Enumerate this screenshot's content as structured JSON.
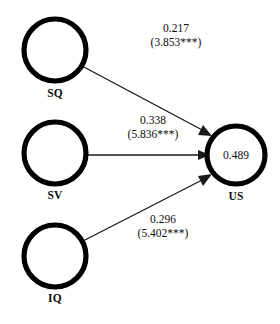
{
  "diagram": {
    "type": "path-diagram",
    "background_color": "#ffffff",
    "stroke_color": "#000000",
    "arrow_color": "#1a1a1a",
    "nodes": [
      {
        "id": "SQ",
        "label": "SQ",
        "value": "",
        "cx": 55,
        "cy": 50,
        "r": 31
      },
      {
        "id": "SV",
        "label": "SV",
        "value": "",
        "cx": 55,
        "cy": 153,
        "r": 31
      },
      {
        "id": "IQ",
        "label": "IQ",
        "value": "",
        "cx": 55,
        "cy": 256,
        "r": 31
      },
      {
        "id": "US",
        "label": "US",
        "value": "0.489",
        "cx": 236,
        "cy": 155,
        "r": 29
      }
    ],
    "edges": [
      {
        "from": "SQ",
        "to": "US",
        "coefficient": "0.217",
        "t_statistic": "(3.853***)",
        "label_x": 176,
        "label_y": 22
      },
      {
        "from": "SV",
        "to": "US",
        "coefficient": "0.338",
        "t_statistic": "(5.836***)",
        "label_x": 153,
        "label_y": 114
      },
      {
        "from": "IQ",
        "to": "US",
        "coefficient": "0.296",
        "t_statistic": "(5.402***)",
        "label_x": 163,
        "label_y": 213
      }
    ]
  }
}
